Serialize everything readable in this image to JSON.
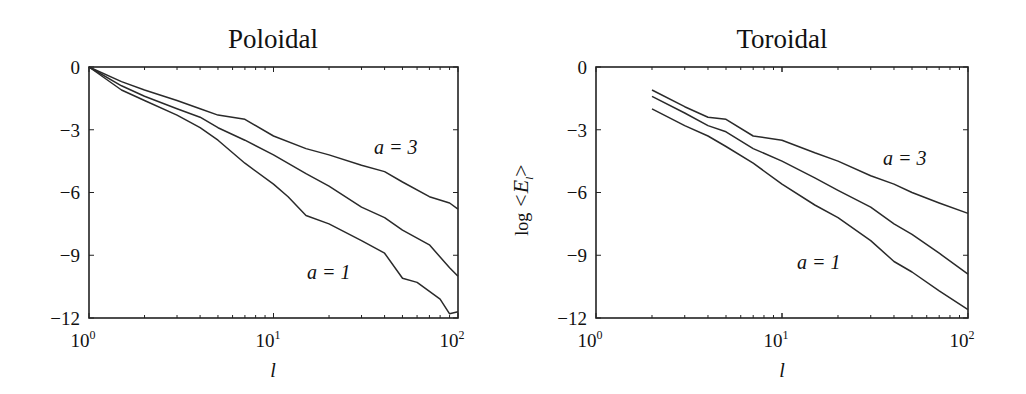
{
  "chart_data": [
    {
      "type": "line",
      "title": "Poloidal",
      "xlabel": "l",
      "ylabel": "",
      "xscale": "log",
      "xlim": [
        1,
        100
      ],
      "ylim": [
        -12,
        0
      ],
      "xticks": [
        "10^0",
        "10^1",
        "10^2"
      ],
      "yticks": [
        0,
        -3,
        -6,
        -9,
        -12
      ],
      "grid": false,
      "annotations": [
        {
          "text": "a = 3",
          "x": 45,
          "y": -3.9
        },
        {
          "text": "a = 1",
          "x": 12,
          "y": -9.7
        }
      ],
      "series": [
        {
          "name": "upper curve (a = 3)",
          "x": [
            1,
            1.5,
            2,
            3,
            4,
            5,
            7,
            10,
            15,
            20,
            30,
            40,
            50,
            70,
            90,
            100
          ],
          "values": [
            0,
            -0.7,
            -1.1,
            -1.6,
            -2.0,
            -2.3,
            -2.5,
            -3.3,
            -3.9,
            -4.2,
            -4.7,
            -5.0,
            -5.5,
            -6.2,
            -6.5,
            -6.8
          ]
        },
        {
          "name": "middle curve (a = 2)",
          "x": [
            1,
            1.5,
            2,
            3,
            4,
            5,
            7,
            10,
            15,
            20,
            30,
            40,
            50,
            70,
            90,
            100
          ],
          "values": [
            0,
            -0.9,
            -1.4,
            -2.0,
            -2.4,
            -2.9,
            -3.5,
            -4.2,
            -5.1,
            -5.7,
            -6.7,
            -7.2,
            -7.8,
            -8.5,
            -9.6,
            -10.0
          ]
        },
        {
          "name": "lower curve (a = 1)",
          "x": [
            1,
            1.5,
            2,
            3,
            4,
            5,
            7,
            10,
            12,
            15,
            20,
            30,
            40,
            50,
            60,
            80,
            90,
            100
          ],
          "values": [
            0,
            -1.1,
            -1.6,
            -2.3,
            -2.9,
            -3.5,
            -4.6,
            -5.6,
            -6.2,
            -7.1,
            -7.5,
            -8.3,
            -8.9,
            -10.1,
            -10.3,
            -11.1,
            -11.8,
            -11.7
          ]
        }
      ]
    },
    {
      "type": "line",
      "title": "Toroidal",
      "xlabel": "l",
      "ylabel": "log <E_l>",
      "xscale": "log",
      "xlim": [
        1,
        100
      ],
      "ylim": [
        -12,
        0
      ],
      "xticks": [
        "10^0",
        "10^1",
        "10^2"
      ],
      "yticks": [
        0,
        -3,
        -6,
        -9,
        -12
      ],
      "grid": false,
      "annotations": [
        {
          "text": "a = 3",
          "x": 45,
          "y": -4.9
        },
        {
          "text": "a = 1",
          "x": 12,
          "y": -9.5
        }
      ],
      "series": [
        {
          "name": "upper curve (a = 3)",
          "x": [
            2,
            3,
            4,
            5,
            7,
            10,
            15,
            20,
            30,
            40,
            50,
            70,
            100
          ],
          "values": [
            -1.1,
            -1.9,
            -2.4,
            -2.5,
            -3.3,
            -3.5,
            -4.1,
            -4.5,
            -5.2,
            -5.6,
            -6.0,
            -6.5,
            -7.0
          ]
        },
        {
          "name": "middle curve (a = 2)",
          "x": [
            2,
            3,
            4,
            5,
            7,
            10,
            15,
            20,
            30,
            40,
            50,
            70,
            100
          ],
          "values": [
            -1.4,
            -2.2,
            -2.8,
            -3.1,
            -3.9,
            -4.5,
            -5.3,
            -5.9,
            -6.7,
            -7.5,
            -8.0,
            -8.9,
            -9.9
          ]
        },
        {
          "name": "lower curve (a = 1)",
          "x": [
            2,
            3,
            4,
            5,
            7,
            10,
            15,
            20,
            30,
            40,
            50,
            70,
            100
          ],
          "values": [
            -2.0,
            -2.8,
            -3.3,
            -3.8,
            -4.6,
            -5.6,
            -6.6,
            -7.2,
            -8.3,
            -9.3,
            -9.8,
            -10.7,
            -11.6
          ]
        }
      ]
    }
  ],
  "panels": [
    {
      "title": "Poloidal",
      "xlabel": "l",
      "ylabel": "",
      "yticks": [
        "0",
        "−3",
        "−6",
        "−9",
        "−12"
      ],
      "xtick_base": "10",
      "xtick_exps": [
        "0",
        "1",
        "2"
      ],
      "label_a3": "a = 3",
      "label_a1": "a = 1"
    },
    {
      "title": "Toroidal",
      "xlabel": "l",
      "ylabel_main": "log ",
      "ylabel_sym": "<E",
      "ylabel_sub": "l",
      "ylabel_close": ">",
      "yticks": [
        "0",
        "−3",
        "−6",
        "−9",
        "−12"
      ],
      "xtick_base": "10",
      "xtick_exps": [
        "0",
        "1",
        "2"
      ],
      "label_a3": "a = 3",
      "label_a1": "a = 1"
    }
  ]
}
